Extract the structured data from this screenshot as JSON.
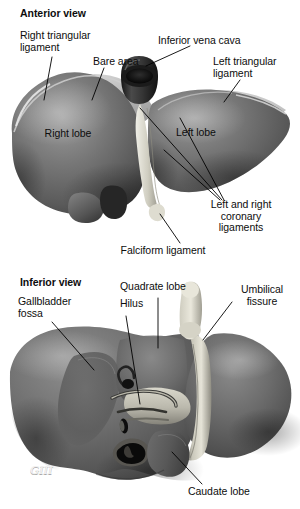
{
  "figure": {
    "background_color": "#ffffff",
    "ink_color": "#0d0d0d",
    "leader_line_color": "#000000",
    "artist_signature": "GIII"
  },
  "panels": [
    {
      "id": "anterior",
      "heading": "Anterior view",
      "labels": [
        {
          "key": "right_triangular_ligament",
          "text": "Right triangular\nligament",
          "align": "left",
          "x": 20,
          "y": 30
        },
        {
          "key": "bare_area",
          "text": "Bare area",
          "align": "left",
          "x": 93,
          "y": 56
        },
        {
          "key": "inferior_vena_cava",
          "text": "Inferior vena cava",
          "align": "left",
          "x": 158,
          "y": 35
        },
        {
          "key": "left_triangular_ligament",
          "text": "Left triangular\nligament",
          "align": "left",
          "x": 213,
          "y": 56
        },
        {
          "key": "right_lobe",
          "text": "Right lobe",
          "align": "center",
          "x": 68,
          "y": 134
        },
        {
          "key": "left_lobe",
          "text": "Left lobe",
          "align": "center",
          "x": 196,
          "y": 133
        },
        {
          "key": "coronary_ligaments",
          "text": "Left and right\ncoronary\nligaments",
          "align": "center",
          "x": 241,
          "y": 205
        },
        {
          "key": "falciform_ligament",
          "text": "Falciform ligament",
          "align": "center",
          "x": 163,
          "y": 249
        }
      ]
    },
    {
      "id": "inferior",
      "heading": "Inferior view",
      "labels": [
        {
          "key": "gallbladder_fossa",
          "text": "Gallbladder\nfossa",
          "align": "left",
          "x": 18,
          "y": 300
        },
        {
          "key": "quadrate_lobe",
          "text": "Quadrate lobe",
          "align": "left",
          "x": 120,
          "y": 286
        },
        {
          "key": "hilus",
          "text": "Hilus",
          "align": "left",
          "x": 120,
          "y": 303
        },
        {
          "key": "umbilical_fissure",
          "text": "Umbilical\nfissure",
          "align": "left",
          "x": 229,
          "y": 289
        },
        {
          "key": "caudate_lobe",
          "text": "Caudate lobe",
          "align": "left",
          "x": 188,
          "y": 489
        }
      ]
    }
  ],
  "anatomy_parts": [
    {
      "name": "right-lobe-anterior",
      "view": "anterior"
    },
    {
      "name": "left-lobe-anterior",
      "view": "anterior"
    },
    {
      "name": "bare-area-surface",
      "view": "anterior"
    },
    {
      "name": "inferior-vena-cava-stump",
      "view": "anterior"
    },
    {
      "name": "gallbladder-anterior",
      "view": "anterior"
    },
    {
      "name": "falciform-ligament-fold",
      "view": "anterior"
    },
    {
      "name": "right-lobe-inferior",
      "view": "inferior"
    },
    {
      "name": "left-lobe-inferior",
      "view": "inferior"
    },
    {
      "name": "quadrate-lobe-surface",
      "view": "inferior"
    },
    {
      "name": "caudate-lobe-surface",
      "view": "inferior"
    },
    {
      "name": "porta-hepatis-vessels",
      "view": "inferior"
    },
    {
      "name": "gallbladder-fossa-depression",
      "view": "inferior"
    },
    {
      "name": "umbilical-fissure-groove",
      "view": "inferior"
    },
    {
      "name": "ligamentum-teres-stump",
      "view": "inferior"
    }
  ],
  "palette": {
    "liver_dark": "#5c5c5c",
    "liver_mid": "#6f6f6f",
    "liver_light": "#8d8d8d",
    "liver_highlight": "#b9b9b9",
    "bare_area": "#c9c9c9",
    "vessel_pale": "#d8d6cd",
    "vena_cava": "#2b2b2b",
    "shadow": "#3a3a3a"
  }
}
